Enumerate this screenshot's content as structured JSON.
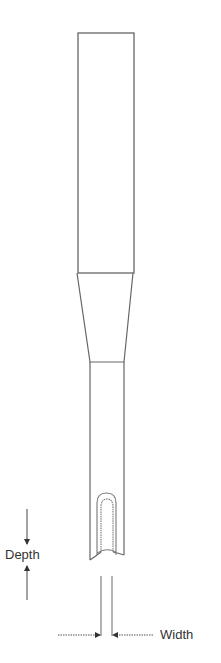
{
  "diagram": {
    "parts": [
      "shank",
      "taper",
      "body",
      "flute-slot",
      "tip"
    ],
    "dimensions": [
      {
        "name": "depth",
        "label": "Depth"
      },
      {
        "name": "width",
        "label": "Width"
      }
    ]
  },
  "labels": {
    "depth": "Depth",
    "width": "Width"
  },
  "colors": {
    "line": "#555555",
    "text": "#333333",
    "background": "#ffffff"
  }
}
